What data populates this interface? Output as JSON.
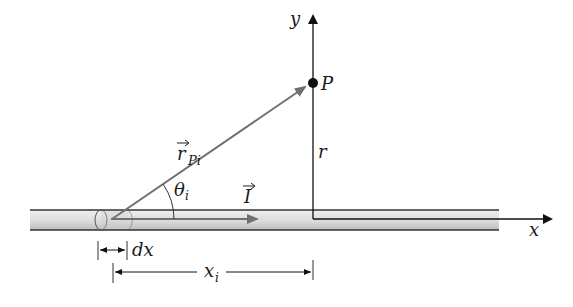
{
  "diagram": {
    "labels": {
      "y_axis": "y",
      "x_axis": "x",
      "point": "P",
      "r_vector": "r",
      "r_vector_subscript": "Pi",
      "angle": "θ",
      "angle_subscript": "i",
      "current": "I",
      "distance_r": "r",
      "element": "dx",
      "position": "x",
      "position_subscript": "i"
    },
    "colors": {
      "wire_fill_light": "#e6e6e6",
      "wire_fill_dark": "#c8c8c8",
      "wire_edge": "#333333",
      "vector_gray": "#707070",
      "axis": "#111111"
    }
  }
}
